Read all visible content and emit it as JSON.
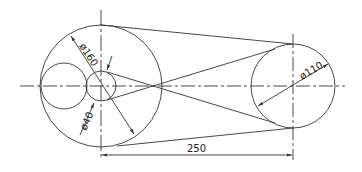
{
  "drawing": {
    "title": "Belt drive pulley diagram",
    "colors": {
      "line": "#333333",
      "background": "#ffffff"
    },
    "large_pulley": {
      "diameter_label": "ø160"
    },
    "hub": {
      "diameter_label": "ø40"
    },
    "right_pulley": {
      "diameter_label": "ø110"
    },
    "center_distance": {
      "label": "250"
    }
  }
}
